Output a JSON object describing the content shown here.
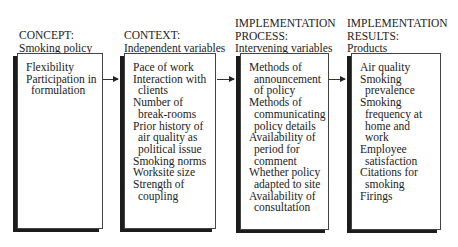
{
  "columns": [
    {
      "heading_lines": [
        "CONCEPT:",
        "Smoking policy"
      ],
      "items": [
        "Flexibility",
        "Participation in formulation"
      ]
    },
    {
      "heading_lines": [
        "CONTEXT:",
        "Independent variables"
      ],
      "items": [
        "Pace of work",
        "Interaction with clients",
        "Number of break-rooms",
        "Prior history of air quality as political issue",
        "Smoking norms",
        "Worksite size",
        "Strength of coupling"
      ]
    },
    {
      "heading_lines": [
        "IMPLEMENTATION",
        "PROCESS:",
        "Intervening variables"
      ],
      "items": [
        "Methods of announcement of policy",
        "Methods of communicating policy details",
        "Availability of period for comment",
        "Whether policy adapted to site",
        "Availability of consultation"
      ]
    },
    {
      "heading_lines": [
        "IMPLEMENTATION",
        "RESULTS:",
        "Products"
      ],
      "items": [
        "Air quality",
        "Smoking prevalence",
        "Smoking frequency at home and work",
        "Employee satisfaction",
        "Citations for smoking",
        "Firings"
      ]
    }
  ],
  "flow": [
    "CONCEPT",
    "CONTEXT",
    "IMPLEMENTATION PROCESS",
    "IMPLEMENTATION RESULTS"
  ]
}
